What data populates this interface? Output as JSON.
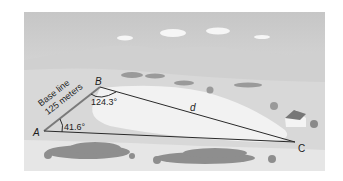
{
  "figure": {
    "vertices": {
      "A": {
        "label": "A",
        "x": 44,
        "y": 131
      },
      "B": {
        "label": "B",
        "x": 100,
        "y": 87
      },
      "C": {
        "label": "C",
        "x": 295,
        "y": 142
      }
    },
    "side_AB": {
      "line1": "Base line",
      "line2": "125 meters"
    },
    "side_BC": {
      "label": "d"
    },
    "angle_A": {
      "label": "41.6°"
    },
    "angle_B": {
      "label": "124.3°"
    },
    "colors": {
      "sky_top": "#c9c9c9",
      "sky_bottom": "#ececec",
      "hills": "#cfcfcf",
      "field": "#dedede",
      "lake": "#f4f4f4",
      "trees": "#8c8c8c",
      "lines": "#2a2a2a"
    }
  }
}
